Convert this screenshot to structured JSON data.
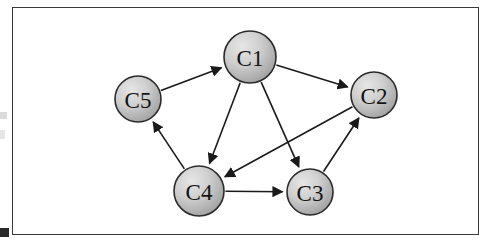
{
  "figure": {
    "kind": "directed-graph-diagram",
    "background_color": "#ffffff",
    "frame": {
      "border_color": "#3a3a3a",
      "fill_color": "#ffffff",
      "x": 12,
      "y": 7,
      "width": 467,
      "height": 228
    },
    "node_style": {
      "fill_light": "#d9d9d9",
      "fill_dark": "#a5a5a5",
      "border_color": "#2b2b2b",
      "label_color": "#141414"
    },
    "edge_style": {
      "color": "#1a1a1a",
      "width": 1.6,
      "arrowhead": "solid-triangle"
    },
    "nodes": [
      {
        "id": "C1",
        "label": "C1",
        "cx": 250,
        "cy": 57,
        "r": 26
      },
      {
        "id": "C2",
        "label": "C2",
        "cx": 374,
        "cy": 95,
        "r": 23
      },
      {
        "id": "C3",
        "label": "C3",
        "cx": 310,
        "cy": 192,
        "r": 23
      },
      {
        "id": "C4",
        "label": "C4",
        "cx": 199,
        "cy": 191,
        "r": 25
      },
      {
        "id": "C5",
        "label": "C5",
        "cx": 138,
        "cy": 99,
        "r": 23
      }
    ],
    "edges": [
      {
        "from": "C5",
        "to": "C1"
      },
      {
        "from": "C1",
        "to": "C2"
      },
      {
        "from": "C1",
        "to": "C4"
      },
      {
        "from": "C1",
        "to": "C3"
      },
      {
        "from": "C2",
        "to": "C4"
      },
      {
        "from": "C4",
        "to": "C3"
      },
      {
        "from": "C4",
        "to": "C5"
      },
      {
        "from": "C3",
        "to": "C2"
      }
    ],
    "artifacts": [
      {
        "name": "left-edge-smudge-upper",
        "x": 0,
        "y": 112,
        "w": 7,
        "h": 7,
        "dark": false
      },
      {
        "name": "left-edge-smudge-lower",
        "x": 0,
        "y": 130,
        "w": 5,
        "h": 9,
        "dark": false
      },
      {
        "name": "bottom-left-mark",
        "x": 0,
        "y": 228,
        "w": 9,
        "h": 9,
        "dark": true
      }
    ]
  }
}
